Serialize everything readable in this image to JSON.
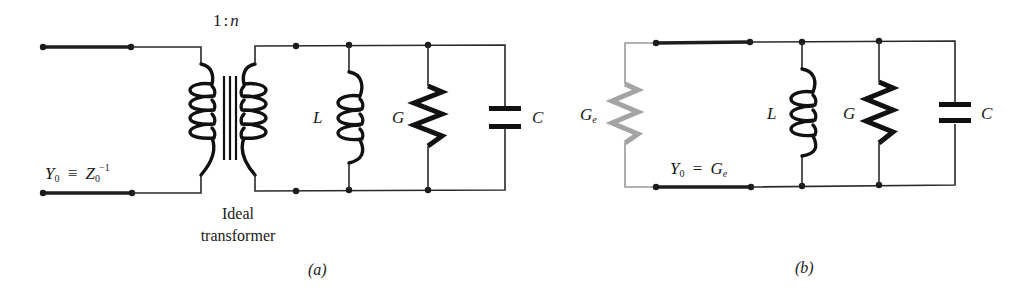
{
  "figure": {
    "panels": [
      {
        "id": "a",
        "caption": "(a)",
        "transformer": {
          "ratio_label": "1:n",
          "ratio_left": "1",
          "ratio_sep": ":",
          "ratio_right": "n",
          "label_line1": "Ideal",
          "label_line2": "transformer"
        },
        "admittance": {
          "lhs": "Y",
          "lhs_sub": "0",
          "op": "≡",
          "rhs": "Z",
          "rhs_sub": "0",
          "rhs_sup": "−1"
        },
        "components": [
          {
            "type": "inductor",
            "label": "L"
          },
          {
            "type": "resistor",
            "label": "G"
          },
          {
            "type": "capacitor",
            "label": "C"
          }
        ]
      },
      {
        "id": "b",
        "caption": "(b)",
        "source": {
          "type": "resistor",
          "label": "G",
          "label_sub": "e",
          "color": "#a4a4a4"
        },
        "admittance": {
          "lhs": "Y",
          "lhs_sub": "0",
          "op": "=",
          "rhs": "G",
          "rhs_sub": "e"
        },
        "components": [
          {
            "type": "inductor",
            "label": "L"
          },
          {
            "type": "resistor",
            "label": "G"
          },
          {
            "type": "capacitor",
            "label": "C"
          }
        ]
      }
    ]
  }
}
